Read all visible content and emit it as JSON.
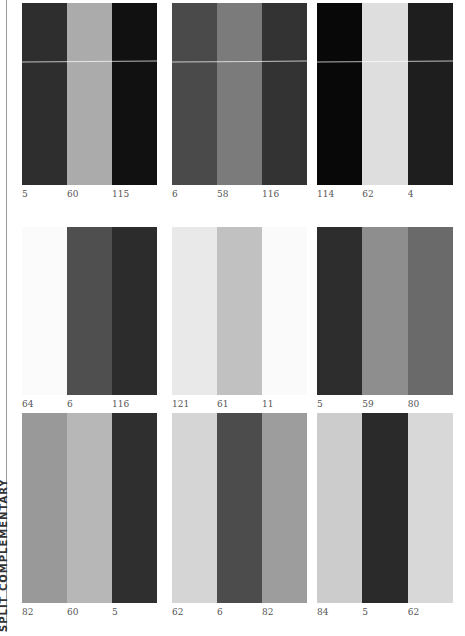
{
  "side_label": "SPLIT COMPLEMENTARY",
  "panels": [
    {
      "stripes": [
        {
          "value": "5",
          "color": "#2e2e2e"
        },
        {
          "value": "60",
          "color": "#ababab"
        },
        {
          "value": "115",
          "color": "#111111"
        }
      ]
    },
    {
      "stripes": [
        {
          "value": "6",
          "color": "#4a4a4a"
        },
        {
          "value": "58",
          "color": "#7b7b7b"
        },
        {
          "value": "116",
          "color": "#333333"
        }
      ]
    },
    {
      "stripes": [
        {
          "value": "114",
          "color": "#080808"
        },
        {
          "value": "62",
          "color": "#dedede"
        },
        {
          "value": "4",
          "color": "#1e1e1e"
        }
      ]
    },
    {
      "stripes": [
        {
          "value": "64",
          "color": "#fbfbfb"
        },
        {
          "value": "6",
          "color": "#4f4f4f"
        },
        {
          "value": "116",
          "color": "#2c2c2c"
        }
      ]
    },
    {
      "stripes": [
        {
          "value": "121",
          "color": "#e9e9e9"
        },
        {
          "value": "61",
          "color": "#c1c1c1"
        },
        {
          "value": "11",
          "color": "#fafafa"
        }
      ]
    },
    {
      "stripes": [
        {
          "value": "5",
          "color": "#2d2d2d"
        },
        {
          "value": "59",
          "color": "#8e8e8e"
        },
        {
          "value": "80",
          "color": "#6a6a6a"
        }
      ]
    },
    {
      "stripes": [
        {
          "value": "82",
          "color": "#999999"
        },
        {
          "value": "60",
          "color": "#b7b7b7"
        },
        {
          "value": "5",
          "color": "#2f2f2f"
        }
      ]
    },
    {
      "stripes": [
        {
          "value": "62",
          "color": "#d5d5d5"
        },
        {
          "value": "6",
          "color": "#4c4c4c"
        },
        {
          "value": "82",
          "color": "#9d9d9d"
        }
      ]
    },
    {
      "stripes": [
        {
          "value": "84",
          "color": "#cccccc"
        },
        {
          "value": "5",
          "color": "#2a2a2a"
        },
        {
          "value": "62",
          "color": "#d8d8d8"
        }
      ]
    }
  ]
}
